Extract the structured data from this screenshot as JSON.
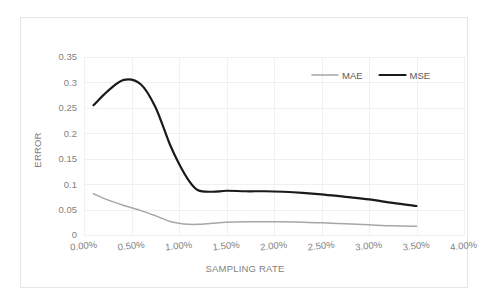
{
  "chart_data": {
    "type": "line",
    "title": "",
    "xlabel": "SAMPLING RATE",
    "ylabel": "ERROR",
    "xlim": [
      0.0,
      4.0
    ],
    "ylim": [
      0.0,
      0.35
    ],
    "grid": true,
    "legend_position": "top-right",
    "x_tick_labels": [
      "0.00%",
      "0.50%",
      "1.00%",
      "1.50%",
      "2.00%",
      "2.50%",
      "3.00%",
      "3.50%",
      "4.00%"
    ],
    "x_tick_values": [
      0.0,
      0.5,
      1.0,
      1.5,
      2.0,
      2.5,
      3.0,
      3.5,
      4.0
    ],
    "y_tick_labels": [
      "0",
      "0.05",
      "0.1",
      "0.15",
      "0.2",
      "0.25",
      "0.3",
      "0.35"
    ],
    "y_tick_values": [
      0,
      0.05,
      0.1,
      0.15,
      0.2,
      0.25,
      0.3,
      0.35
    ],
    "x": [
      0.1,
      0.25,
      0.42,
      0.6,
      0.75,
      0.9,
      1.0,
      1.1,
      1.2,
      1.35,
      1.5,
      1.7,
      1.9,
      2.1,
      2.3,
      2.5,
      2.75,
      3.0,
      3.25,
      3.5
    ],
    "series": [
      {
        "name": "MAE",
        "color": "#a6a6a6",
        "line_width": 1.5,
        "values": [
          0.081,
          0.069,
          0.058,
          0.048,
          0.038,
          0.027,
          0.023,
          0.021,
          0.021,
          0.023,
          0.025,
          0.026,
          0.026,
          0.026,
          0.025,
          0.024,
          0.022,
          0.02,
          0.018,
          0.017
        ]
      },
      {
        "name": "MSE",
        "color": "#1a1a1a",
        "line_width": 2.2,
        "values": [
          0.255,
          0.283,
          0.305,
          0.296,
          0.252,
          0.18,
          0.14,
          0.108,
          0.088,
          0.085,
          0.087,
          0.086,
          0.086,
          0.085,
          0.083,
          0.08,
          0.075,
          0.07,
          0.063,
          0.057
        ]
      }
    ]
  },
  "legend": {
    "items": [
      {
        "label": "MAE",
        "color": "#a6a6a6",
        "width": 1.5
      },
      {
        "label": "MSE",
        "color": "#1a1a1a",
        "width": 2.2
      }
    ]
  },
  "axes": {
    "y_title": "ERROR",
    "x_title": "SAMPLING RATE"
  }
}
